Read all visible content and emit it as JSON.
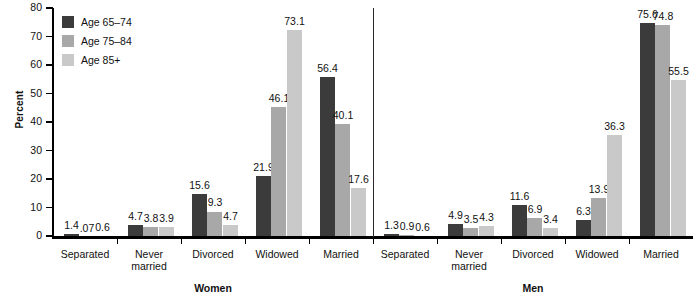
{
  "chart_data": {
    "type": "bar",
    "title": "",
    "subtitle": "",
    "xlabel": "",
    "ylabel": "Percent",
    "ylim": [
      0,
      80
    ],
    "yticks": [
      0,
      10,
      20,
      30,
      40,
      50,
      60,
      70,
      80
    ],
    "grid": false,
    "legend_position": "top-left",
    "orientation": "vertical",
    "categories": [
      "Separated",
      "Never\nmarried",
      "Divorced",
      "Widowed",
      "Married"
    ],
    "panels": [
      {
        "name": "Women",
        "label": "Women",
        "series": [
          {
            "name": "Age 65–74",
            "values": [
              1.4,
              4.7,
              15.6,
              21.9,
              56.4
            ],
            "value_labels": [
              "1.4",
              "4.7",
              "15.6",
              "21.9",
              "56.4"
            ]
          },
          {
            "name": "Age 75–84",
            "values": [
              0.07,
              3.8,
              9.3,
              46.1,
              40.1
            ],
            "value_labels": [
              ".07",
              "3.8",
              "9.3",
              "46.1",
              "40.1"
            ]
          },
          {
            "name": "Age 85+",
            "values": [
              0.6,
              3.9,
              4.7,
              73.1,
              17.6
            ],
            "value_labels": [
              "0.6",
              "3.9",
              "4.7",
              "73.1",
              "17.6"
            ]
          }
        ]
      },
      {
        "name": "Men",
        "label": "Men",
        "series": [
          {
            "name": "Age 65–74",
            "values": [
              1.3,
              4.9,
              11.6,
              6.3,
              75.6
            ],
            "value_labels": [
              "1.3",
              "4.9",
              "11.6",
              "6.3",
              "75.6"
            ]
          },
          {
            "name": "Age 75–84",
            "values": [
              0.9,
              3.5,
              6.9,
              13.9,
              74.8
            ],
            "value_labels": [
              "0.9",
              "3.5",
              "6.9",
              "13.9",
              "74.8"
            ]
          },
          {
            "name": "Age 85+",
            "values": [
              0.6,
              4.3,
              3.4,
              36.3,
              55.5
            ],
            "value_labels": [
              "0.6",
              "4.3",
              "3.4",
              "36.3",
              "55.5"
            ]
          }
        ]
      }
    ],
    "legend": [
      {
        "label": "Age 65–74",
        "color": "#3b3b3b"
      },
      {
        "label": "Age 75–84",
        "color": "#a8a8a8"
      },
      {
        "label": "Age 85+",
        "color": "#c9c9c9"
      }
    ],
    "series_colors": [
      "#3b3b3b",
      "#a8a8a8",
      "#c9c9c9"
    ],
    "axis_color": "#000000"
  }
}
